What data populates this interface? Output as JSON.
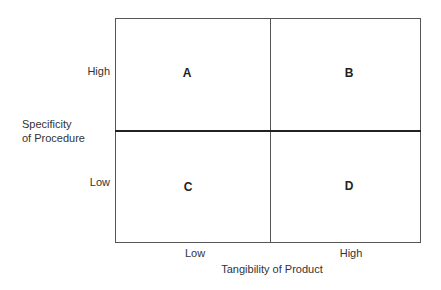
{
  "diagram": {
    "type": "2x2 matrix",
    "y_axis": {
      "title_line1": "Specificity",
      "title_line2": "of Procedure",
      "levels": [
        "High",
        "Low"
      ]
    },
    "x_axis": {
      "title": "Tangibility of Product",
      "levels": [
        "Low",
        "High"
      ]
    },
    "quadrants": [
      {
        "label": "A",
        "x_level": "Low",
        "y_level": "High"
      },
      {
        "label": "B",
        "x_level": "High",
        "y_level": "High"
      },
      {
        "label": "C",
        "x_level": "Low",
        "y_level": "Low"
      },
      {
        "label": "D",
        "x_level": "High",
        "y_level": "Low"
      }
    ]
  }
}
